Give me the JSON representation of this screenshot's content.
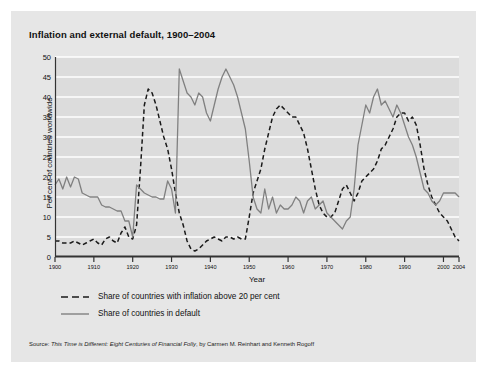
{
  "title": "Inflation and external default, 1900–2004",
  "source": {
    "prefix": "Source: ",
    "work": "This Time is Different: Eight Centuries of Financial Folly",
    "suffix": ", by Carmen M. Reinhart and Kenneth Rogoff"
  },
  "legend": [
    {
      "label": "Share of countries with inflation above 20 per cent",
      "style": "dashed",
      "color": "#1a1a1a"
    },
    {
      "label": "Share of countries in default",
      "style": "solid",
      "color": "#808080"
    }
  ],
  "colors": {
    "card": "#e6e6e6",
    "plot_bg": "#dcdcdc",
    "gridline": "#ffffff",
    "axis": "#333333",
    "inflation": "#1a1a1a",
    "default": "#808080"
  },
  "chart_data": {
    "type": "line",
    "title": "Inflation and external default, 1900–2004",
    "xlabel": "Year",
    "ylabel": "Per cent of countries worldwide",
    "xlim": [
      1900,
      2004
    ],
    "ylim": [
      0,
      50
    ],
    "yticks": [
      0,
      5,
      10,
      15,
      20,
      25,
      30,
      35,
      40,
      45,
      50
    ],
    "xticks": [
      1900,
      1910,
      1920,
      1930,
      1940,
      1950,
      1960,
      1970,
      1980,
      1990,
      2000,
      2004
    ],
    "xtick_labels": [
      "1900",
      "1910",
      "1920",
      "1930",
      "1940",
      "1950",
      "1960",
      "1970",
      "1980",
      "1990",
      "2000",
      "2004"
    ],
    "grid": "horizontal",
    "legend_position": "below",
    "x": [
      1900,
      1901,
      1902,
      1903,
      1904,
      1905,
      1906,
      1907,
      1908,
      1909,
      1910,
      1911,
      1912,
      1913,
      1914,
      1915,
      1916,
      1917,
      1918,
      1919,
      1920,
      1921,
      1922,
      1923,
      1924,
      1925,
      1926,
      1927,
      1928,
      1929,
      1930,
      1931,
      1932,
      1933,
      1934,
      1935,
      1936,
      1937,
      1938,
      1939,
      1940,
      1941,
      1942,
      1943,
      1944,
      1945,
      1946,
      1947,
      1948,
      1949,
      1950,
      1951,
      1952,
      1953,
      1954,
      1955,
      1956,
      1957,
      1958,
      1959,
      1960,
      1961,
      1962,
      1963,
      1964,
      1965,
      1966,
      1967,
      1968,
      1969,
      1970,
      1971,
      1972,
      1973,
      1974,
      1975,
      1976,
      1977,
      1978,
      1979,
      1980,
      1981,
      1982,
      1983,
      1984,
      1985,
      1986,
      1987,
      1988,
      1989,
      1990,
      1991,
      1992,
      1993,
      1994,
      1995,
      1996,
      1997,
      1998,
      1999,
      2000,
      2001,
      2002,
      2003,
      2004
    ],
    "series": [
      {
        "name": "Share of countries with inflation above 20 per cent",
        "style": "dashed",
        "color": "#1a1a1a",
        "values": [
          4,
          4,
          3.5,
          3.5,
          3.5,
          4,
          3.5,
          3,
          3.5,
          4,
          4.5,
          3.5,
          3,
          4.5,
          5,
          4,
          3.5,
          6,
          7.5,
          5,
          4.5,
          8,
          22,
          38,
          42,
          41,
          38,
          34,
          30,
          27,
          22,
          16,
          11,
          8,
          4,
          2,
          1.5,
          2,
          3,
          4,
          4.5,
          5,
          4.5,
          4,
          5,
          5,
          4.5,
          5,
          4.5,
          4.5,
          10,
          16,
          19,
          22,
          27,
          31,
          35,
          37,
          38,
          37,
          36,
          35,
          35,
          33,
          31,
          27,
          22,
          17,
          13,
          11,
          10,
          10,
          11,
          14,
          17,
          18,
          16,
          14,
          16,
          19,
          20,
          21,
          22,
          24,
          27,
          28,
          30,
          32,
          35,
          36,
          36,
          34,
          35,
          33,
          28,
          22,
          18,
          15,
          13,
          11,
          10,
          9,
          7,
          5,
          4
        ]
      },
      {
        "name": "Share of countries in default",
        "style": "solid",
        "color": "#808080",
        "values": [
          18,
          19.5,
          17,
          20,
          17.5,
          20,
          19.5,
          16,
          15.5,
          15,
          15,
          15,
          13,
          12.5,
          12.5,
          12,
          11.5,
          11.5,
          9,
          9,
          5,
          18,
          17,
          16,
          15.5,
          15,
          15,
          14.5,
          14.5,
          19,
          17,
          11,
          47,
          44,
          41,
          40,
          38,
          41,
          40,
          36,
          34,
          38,
          42,
          45,
          47,
          45,
          43,
          40,
          36,
          32,
          24,
          15,
          12,
          11,
          17,
          12,
          15,
          11,
          13,
          12,
          12,
          13,
          15,
          14,
          11,
          14,
          15,
          12,
          13,
          14,
          11,
          10,
          9,
          8,
          7,
          9,
          10,
          17,
          28,
          33,
          38,
          36,
          40,
          42,
          38,
          39,
          37,
          35,
          38,
          36,
          33,
          30,
          28,
          25,
          21,
          17,
          16,
          14,
          13,
          14,
          16,
          16,
          16,
          16,
          15
        ]
      }
    ]
  }
}
